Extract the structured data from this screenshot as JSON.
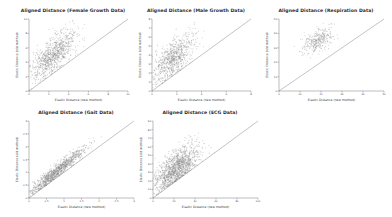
{
  "figure": {
    "background_color": "#ffffff",
    "point_color": "#8c8c8c",
    "line_color": "#7a7a7a",
    "axis_color": "#555555",
    "title_color": "#2b2b2b",
    "rows": 2,
    "cols": 3
  },
  "chart_data": [
    {
      "type": "scatter",
      "title": "Aligned Distance (Female Growth Data)",
      "xlabel": "Elastic Distance (new method)",
      "ylabel": "Elastic Distance (old method)",
      "xlim": [
        0,
        10
      ],
      "ylim": [
        0,
        10
      ],
      "xticks": [
        "0",
        "2",
        "4",
        "6",
        "8",
        "10"
      ],
      "yticks": [
        "0",
        "2",
        "4",
        "6",
        "8",
        "10"
      ],
      "grid": false,
      "legend": "none",
      "reference_line": {
        "type": "identity",
        "slope": 1,
        "intercept": 0,
        "label": "y = x"
      },
      "cloud": {
        "n_points": 900,
        "x_center": 2.5,
        "y_center": 5.1,
        "x_spread": 1.15,
        "y_spread": 1.75,
        "correlation": 0.72,
        "note": "cloud lies above the identity line: old method distances exceed new method"
      }
    },
    {
      "type": "scatter",
      "title": "Aligned Distance (Male Growth Data)",
      "xlabel": "Elastic Distance (new method)",
      "ylabel": "Elastic Distance (old method)",
      "xlim": [
        0,
        8
      ],
      "ylim": [
        0,
        8
      ],
      "xticks": [
        "0",
        "2",
        "4",
        "6",
        "8"
      ],
      "yticks": [
        "0",
        "1",
        "2",
        "3",
        "4",
        "5",
        "6",
        "7",
        "8"
      ],
      "grid": false,
      "legend": "none",
      "reference_line": {
        "type": "identity",
        "slope": 1,
        "intercept": 0,
        "label": "y = x"
      },
      "cloud": {
        "n_points": 800,
        "x_center": 1.7,
        "y_center": 3.6,
        "x_spread": 0.85,
        "y_spread": 1.35,
        "correlation": 0.68,
        "note": "cloud lies above the identity line"
      }
    },
    {
      "type": "scatter",
      "title": "Aligned Distance (Respiration Data)",
      "xlabel": "Elastic Distance (new method)",
      "ylabel": "Elastic Distance (old method)",
      "xlim": [
        0,
        50
      ],
      "ylim": [
        0,
        50
      ],
      "xticks": [
        "0",
        "10",
        "20",
        "30",
        "40",
        "50"
      ],
      "yticks": [
        "0",
        "10",
        "20",
        "30",
        "40",
        "50"
      ],
      "grid": false,
      "legend": "none",
      "reference_line": {
        "type": "identity",
        "slope": 1,
        "intercept": 0,
        "label": "y = x"
      },
      "cloud": {
        "n_points": 320,
        "x_center": 18.5,
        "y_center": 35.0,
        "x_spread": 3.6,
        "y_spread": 4.2,
        "correlation": 0.45,
        "note": "compact cloud well above the identity line"
      }
    },
    {
      "type": "scatter",
      "title": "Aligned Distance (Gait Data)",
      "xlabel": "Elastic Distance (new method)",
      "ylabel": "Elastic Distance (old method)",
      "xlim": [
        0,
        3
      ],
      "ylim": [
        0,
        3
      ],
      "xticks": [
        "0",
        "0.5",
        "1",
        "1.5",
        "2",
        "2.5",
        "3"
      ],
      "yticks": [
        "0",
        "0.5",
        "1",
        "1.5",
        "2",
        "2.5",
        "3"
      ],
      "grid": false,
      "legend": "none",
      "reference_line": {
        "type": "identity",
        "slope": 1,
        "intercept": 0,
        "label": "y = x"
      },
      "cloud": {
        "n_points": 1100,
        "x_center": 0.78,
        "y_center": 1.02,
        "x_spread": 0.42,
        "y_spread": 0.48,
        "correlation": 0.96,
        "note": "narrow elongated band hugging and just above the identity line"
      }
    },
    {
      "type": "scatter",
      "title": "Aligned Distance (ECG Data)",
      "xlabel": "Elastic Distance (new method)",
      "ylabel": "Elastic Distance (old method)",
      "xlim": [
        0,
        100
      ],
      "ylim": [
        0,
        100
      ],
      "xticks": [
        "0",
        "20",
        "40",
        "60",
        "80",
        "100"
      ],
      "yticks": [
        "0",
        "10",
        "20",
        "30",
        "40",
        "50",
        "60",
        "70",
        "80",
        "90"
      ],
      "grid": false,
      "legend": "none",
      "reference_line": {
        "type": "identity",
        "slope": 1,
        "intercept": 0,
        "label": "y = x"
      },
      "cloud": {
        "n_points": 1400,
        "x_center": 22.0,
        "y_center": 38.0,
        "x_spread": 10.5,
        "y_spread": 15.0,
        "correlation": 0.7,
        "note": "dense wedge above the identity line with a sparse upper plume"
      }
    }
  ]
}
